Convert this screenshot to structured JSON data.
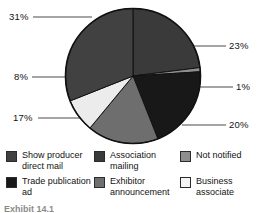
{
  "chart_data": {
    "type": "pie",
    "title": "",
    "subtitle": "",
    "xlabel": "",
    "ylabel": "",
    "grid": false,
    "legend_position": "bottom",
    "categories": [
      "Show producer direct mail",
      "Association mailing",
      "Not notified",
      "Trade publication ad",
      "Exhibitor announcement",
      "Business associate"
    ],
    "values": [
      31,
      23,
      1,
      20,
      17,
      8
    ],
    "slices": [
      {
        "label": "Association mailing",
        "value": 23,
        "display": "23%",
        "color": "#3a3a3a",
        "start_angle": 0,
        "end_angle": 82.8
      },
      {
        "label": "Not notified",
        "value": 1,
        "display": "1%",
        "color": "#8e8e8e",
        "start_angle": 82.8,
        "end_angle": 86.4
      },
      {
        "label": "Trade publication ad",
        "value": 20,
        "display": "20%",
        "color": "#181818",
        "start_angle": 86.4,
        "end_angle": 158.4
      },
      {
        "label": "Exhibitor announcement",
        "value": 17,
        "display": "17%",
        "color": "#6e6e6e",
        "start_angle": 158.4,
        "end_angle": 219.6
      },
      {
        "label": "Business associate",
        "value": 8,
        "display": "8%",
        "color": "#ececec",
        "start_angle": 219.6,
        "end_angle": 248.4
      },
      {
        "label": "Show producer direct mail",
        "value": 31,
        "display": "31%",
        "color": "#414141",
        "start_angle": 248.4,
        "end_angle": 360
      }
    ],
    "labels": [
      {
        "text": "31%",
        "left": 9,
        "top": 12
      },
      {
        "text": "23%",
        "left": 229,
        "top": 41
      },
      {
        "text": "1%",
        "left": 236,
        "top": 82
      },
      {
        "text": "20%",
        "left": 229,
        "top": 120
      },
      {
        "text": "17%",
        "left": 13,
        "top": 113
      },
      {
        "text": "8%",
        "left": 14,
        "top": 72
      }
    ]
  },
  "legend": {
    "items": [
      {
        "label": "Show producer direct mail",
        "color": "#414141",
        "swatch_name": "legend-swatch-show-producer-direct-mail"
      },
      {
        "label": "Association mailing",
        "color": "#3a3a3a",
        "swatch_name": "legend-swatch-association-mailing"
      },
      {
        "label": "Not notified",
        "color": "#8e8e8e",
        "swatch_name": "legend-swatch-not-notified"
      },
      {
        "label": "Trade publication ad",
        "color": "#181818",
        "swatch_name": "legend-swatch-trade-publication-ad"
      },
      {
        "label": "Exhibitor announcement",
        "color": "#6e6e6e",
        "swatch_name": "legend-swatch-exhibitor-announcement"
      },
      {
        "label": "Business associate",
        "color": "#f4f4f4",
        "swatch_name": "legend-swatch-business-associate"
      }
    ]
  },
  "caption": {
    "text": "Exhibit 14.1"
  },
  "colors": {
    "background": "#ffffff",
    "outline": "#111111",
    "text": "#121212"
  }
}
